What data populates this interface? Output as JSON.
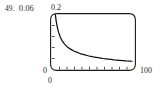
{
  "caption": {
    "index": "49.",
    "value": "0.06"
  },
  "chart_data": {
    "type": "line",
    "title": "",
    "subtitle": "",
    "xlabel": "",
    "ylabel": "",
    "xlim": [
      0,
      100
    ],
    "ylim": [
      0,
      0.2
    ],
    "xticklabels": [
      "0",
      "100"
    ],
    "yticklabels": [
      "0",
      "0.2"
    ],
    "grid": false,
    "legend": null,
    "annotations": [],
    "axis_style": {
      "frame": "rounded-box",
      "x_tick_count": 10,
      "y_tick_count": 4,
      "tick_direction": "inward",
      "line_color": "#1a1a1a"
    },
    "series": [
      {
        "name": "decay",
        "color": "#111111",
        "x": [
          4,
          5,
          6,
          7,
          8,
          10,
          12,
          15,
          18,
          22,
          26,
          30,
          35,
          40,
          45,
          50,
          56,
          62,
          68,
          75,
          82,
          90,
          97
        ],
        "y": [
          0.2,
          0.178,
          0.16,
          0.146,
          0.135,
          0.118,
          0.106,
          0.093,
          0.084,
          0.075,
          0.068,
          0.063,
          0.057,
          0.053,
          0.049,
          0.046,
          0.043,
          0.04,
          0.038,
          0.035,
          0.033,
          0.031,
          0.03
        ]
      }
    ]
  }
}
